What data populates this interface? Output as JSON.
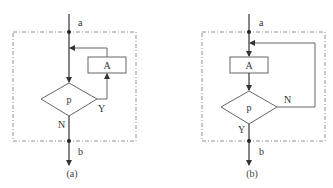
{
  "diagrams": [
    {
      "id": "a",
      "caption": "(a)",
      "entry_label": "a",
      "exit_label": "b",
      "process_label": "A",
      "condition_label": "p",
      "true_branch_label": "Y",
      "false_branch_label": "N",
      "structure": "while-loop (test first: p true → A → back to test; N exits)"
    },
    {
      "id": "b",
      "caption": "(b)",
      "entry_label": "a",
      "exit_label": "b",
      "process_label": "A",
      "condition_label": "p",
      "true_branch_label": "Y",
      "false_branch_label": "N",
      "structure": "do-until loop (A executed first; p N → loop back; Y exits)"
    }
  ],
  "colors": {
    "line": "#333333",
    "shape_stroke": "#666666",
    "boundary": "#777777",
    "background": "#ffffff"
  }
}
